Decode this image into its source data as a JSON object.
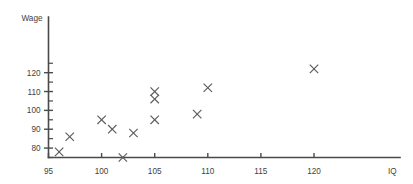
{
  "chart_data": {
    "type": "scatter",
    "title": "",
    "xlabel": "IQ",
    "ylabel": "Wage",
    "xlim": [
      95,
      122
    ],
    "ylim": [
      75,
      126
    ],
    "grid": false,
    "legend": null,
    "marker": "x",
    "marker_color": "#5c5c5c",
    "x_ticks": [
      95,
      100,
      105,
      110,
      115,
      120
    ],
    "x_tick_labels": [
      "95",
      "100",
      "105",
      "110",
      "115",
      "120"
    ],
    "y_ticks": [
      80,
      90,
      100,
      110,
      120
    ],
    "y_tick_labels": [
      "80",
      "90",
      "100",
      "110",
      "120"
    ],
    "y_minor_ticks": [
      75,
      85,
      95,
      105,
      115,
      125
    ],
    "points": [
      {
        "x": 96,
        "y": 78
      },
      {
        "x": 97,
        "y": 86
      },
      {
        "x": 100,
        "y": 95
      },
      {
        "x": 101,
        "y": 90
      },
      {
        "x": 102,
        "y": 75
      },
      {
        "x": 103,
        "y": 88
      },
      {
        "x": 105,
        "y": 110
      },
      {
        "x": 105,
        "y": 106
      },
      {
        "x": 105,
        "y": 95
      },
      {
        "x": 109,
        "y": 98
      },
      {
        "x": 110,
        "y": 112
      },
      {
        "x": 120,
        "y": 122
      }
    ]
  }
}
